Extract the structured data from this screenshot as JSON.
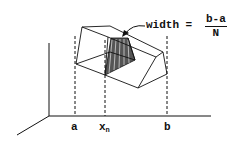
{
  "diagram": {
    "type": "3d-integration-slab",
    "labels": {
      "a": "a",
      "xn_base": "x",
      "xn_sub": "n",
      "b": "b",
      "width_text": "width =",
      "frac_num": "b-a",
      "frac_den": "N"
    },
    "colors": {
      "line": "#111111",
      "shade": "#555555"
    }
  }
}
